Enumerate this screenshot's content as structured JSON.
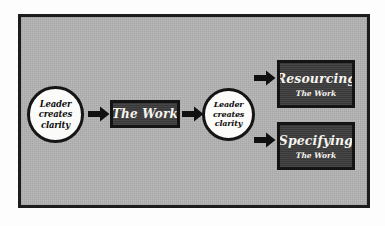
{
  "diagram": {
    "background_color": "#b2b2b2",
    "frame_border_color": "#1c1c1c",
    "box_fill_color": "#3d3d3d",
    "box_text_color": "#f6f4ef",
    "circle_fill_color": "#fbfbfa",
    "arrow_color": "#101010",
    "nodes": {
      "circle_1": {
        "line_1": "Leader",
        "line_2": "creates",
        "line_3": "clarity"
      },
      "circle_2": {
        "line_1": "Leader",
        "line_2": "creates",
        "line_3": "clarity"
      },
      "box_work": {
        "title": "The Work"
      },
      "box_resourcing": {
        "title": "Resourcing",
        "subtitle": "The Work"
      },
      "box_specifying": {
        "title": "Specifying",
        "subtitle": "The Work"
      }
    },
    "arrows": [
      {
        "name": "arrow-clarity-to-work",
        "direction": "right"
      },
      {
        "name": "arrow-work-to-clarity",
        "direction": "right"
      },
      {
        "name": "arrow-clarity-to-resourcing",
        "direction": "right"
      },
      {
        "name": "arrow-clarity-to-specifying",
        "direction": "right"
      }
    ]
  }
}
